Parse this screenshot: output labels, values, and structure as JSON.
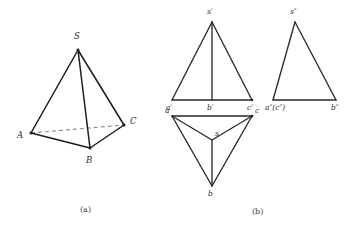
{
  "figure": {
    "captions": [
      {
        "id": "caption-a",
        "text": "(a)",
        "x": 80,
        "y": 212
      },
      {
        "id": "caption-b",
        "text": "(b)",
        "x": 252,
        "y": 214
      }
    ],
    "colors": {
      "solid_edge": "#1c1c1c",
      "hidden_edge": "#8a8a8a",
      "projection_edge": "#2a2a2a",
      "label_text": "#2b2b2b",
      "caption_text": "#3a3a3a",
      "background": "#ffffff"
    }
  },
  "pictorial": {
    "name": "tetrahedron-pictorial-view",
    "vertices": {
      "S": {
        "label": "S",
        "x": 78,
        "y": 50,
        "label_x": 74,
        "label_y": 39
      },
      "A": {
        "label": "A",
        "x": 31,
        "y": 133,
        "label_x": 17,
        "label_y": 138
      },
      "B": {
        "label": "B",
        "x": 90,
        "y": 148,
        "label_x": 86,
        "label_y": 163
      },
      "C": {
        "label": "C",
        "x": 124,
        "y": 125,
        "label_x": 130,
        "label_y": 124
      }
    },
    "visible_edges": [
      {
        "name": "edge-S-A",
        "from": "S",
        "to": "A"
      },
      {
        "name": "edge-S-B",
        "from": "S",
        "to": "B"
      },
      {
        "name": "edge-S-C",
        "from": "S",
        "to": "C"
      },
      {
        "name": "edge-A-B",
        "from": "A",
        "to": "B"
      },
      {
        "name": "edge-B-C",
        "from": "B",
        "to": "C"
      }
    ],
    "hidden_edges": [
      {
        "name": "edge-A-C-hidden",
        "from": "A",
        "to": "C"
      }
    ]
  },
  "front_view": {
    "name": "front-view-projection",
    "title_hint": "V projection",
    "vertices": {
      "s_prime": {
        "label": "s′",
        "x": 212,
        "y": 22,
        "label_x": 207,
        "label_y": 14
      },
      "a_prime": {
        "label": "a′",
        "x": 172,
        "y": 100,
        "label_x": 166,
        "label_y": 110
      },
      "b_prime": {
        "label": "b′",
        "x": 212,
        "y": 100,
        "label_x": 207,
        "label_y": 110
      },
      "c_prime": {
        "label": "c′",
        "x": 252,
        "y": 100,
        "label_x": 247,
        "label_y": 110
      }
    },
    "edges": [
      {
        "name": "edge-sprime-aprime",
        "from": "s_prime",
        "to": "a_prime"
      },
      {
        "name": "edge-sprime-cprime",
        "from": "s_prime",
        "to": "c_prime"
      },
      {
        "name": "edge-sprime-bprime",
        "from": "s_prime",
        "to": "b_prime"
      },
      {
        "name": "edge-aprime-cprime",
        "from": "a_prime",
        "to": "c_prime"
      }
    ]
  },
  "top_view": {
    "name": "top-view-projection",
    "title_hint": "H projection",
    "vertices": {
      "a": {
        "label": "a",
        "x": 172,
        "y": 116,
        "label_x": 165,
        "label_y": 113
      },
      "c": {
        "label": "c",
        "x": 252,
        "y": 116,
        "label_x": 255,
        "label_y": 113
      },
      "b": {
        "label": "b",
        "x": 212,
        "y": 186,
        "label_x": 208,
        "label_y": 196
      },
      "s": {
        "label": "s",
        "x": 212,
        "y": 140,
        "label_x": 215,
        "label_y": 136
      }
    },
    "edges": [
      {
        "name": "edge-a-c",
        "from": "a",
        "to": "c"
      },
      {
        "name": "edge-a-b",
        "from": "a",
        "to": "b"
      },
      {
        "name": "edge-c-b",
        "from": "c",
        "to": "b"
      },
      {
        "name": "edge-a-s",
        "from": "a",
        "to": "s"
      },
      {
        "name": "edge-c-s",
        "from": "c",
        "to": "s"
      },
      {
        "name": "edge-b-s",
        "from": "b",
        "to": "s"
      }
    ]
  },
  "side_view": {
    "name": "side-view-projection",
    "title_hint": "W projection",
    "vertices": {
      "s_dprime": {
        "label": "s″",
        "x": 295,
        "y": 22,
        "label_x": 290,
        "label_y": 14
      },
      "ac_dprime": {
        "label": "a″(c″)",
        "x": 273,
        "y": 100,
        "label_x": 265,
        "label_y": 110
      },
      "b_dprime": {
        "label": "b″",
        "x": 336,
        "y": 100,
        "label_x": 331,
        "label_y": 110
      }
    },
    "edges": [
      {
        "name": "edge-sdprime-acdprime",
        "from": "s_dprime",
        "to": "ac_dprime"
      },
      {
        "name": "edge-sdprime-bdprime",
        "from": "s_dprime",
        "to": "b_dprime"
      },
      {
        "name": "edge-acdprime-bdprime",
        "from": "ac_dprime",
        "to": "b_dprime"
      }
    ]
  }
}
